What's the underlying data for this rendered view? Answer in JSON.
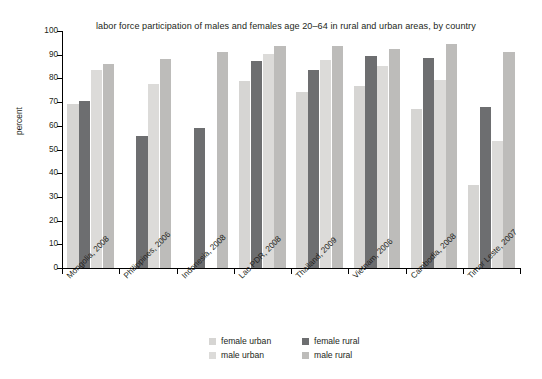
{
  "chart_data": {
    "type": "bar",
    "title": "labor force participation of males and females age 20–64 in rural and urban areas, by country",
    "xlabel": "",
    "ylabel": "percent",
    "ylim": [
      0,
      100
    ],
    "ytick_step": 10,
    "yticks": [
      "100",
      "90",
      "80",
      "70",
      "60",
      "50",
      "40",
      "30",
      "20",
      "10",
      "0"
    ],
    "grid": false,
    "legend_position": "bottom",
    "categories": [
      "Mongolia, 2008",
      "Philippines, 2006",
      "Indonesia, 2008",
      "Lao PDR, 2008",
      "Thailand, 2009",
      "Vietnam, 2006",
      "Cambodia, 2008",
      "Timor Leste, 2007"
    ],
    "series": [
      {
        "name": "female urban",
        "color": "#d6d5d3",
        "values": [
          69.2,
          0,
          0,
          79.0,
          74.3,
          76.6,
          67.2,
          35.0
        ]
      },
      {
        "name": "female rural",
        "color": "#6d6e70",
        "values": [
          70.3,
          55.8,
          58.9,
          87.4,
          83.4,
          89.6,
          88.6,
          68.0
        ]
      },
      {
        "name": "male urban",
        "color": "#dcdbd9",
        "values": [
          83.5,
          77.8,
          0,
          90.4,
          87.9,
          85.2,
          79.5,
          53.5
        ]
      },
      {
        "name": "male rural",
        "color": "#bdbcba",
        "values": [
          86.2,
          88.3,
          91.2,
          93.5,
          93.5,
          92.4,
          94.6,
          91.0
        ]
      }
    ]
  },
  "legend": {
    "items": [
      {
        "label": "female urban",
        "color": "#d6d5d3"
      },
      {
        "label": "female rural",
        "color": "#6d6e70"
      },
      {
        "label": "male urban",
        "color": "#dcdbd9"
      },
      {
        "label": "male rural",
        "color": "#bdbcba"
      }
    ]
  },
  "axis": {
    "y_title": "percent"
  }
}
